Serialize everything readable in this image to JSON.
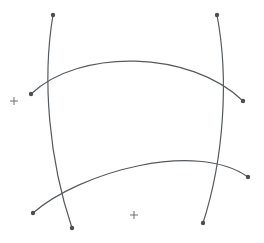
{
  "figure": {
    "width": 264,
    "height": 243,
    "background_color": "#ffffff",
    "stroke_color": "#555a5e",
    "stroke_width": 1.2,
    "endpoint_dot_color": "#4a4f53",
    "endpoint_dot_radius": 2.2,
    "registration_mark_color": "#6d7276"
  },
  "curves": [
    {
      "id": "left-vertical-curve",
      "name": "left-vertical-curve",
      "orientation": "vertical",
      "bows": "left",
      "start": {
        "x": 53,
        "y": 15
      },
      "end": {
        "x": 72,
        "y": 228
      },
      "control1": {
        "x": 42,
        "y": 80
      },
      "control2": {
        "x": 49,
        "y": 160
      },
      "path": "M 53 15 C 42 80 49 160 72 228",
      "endpoints": [
        {
          "x": 53,
          "y": 15
        },
        {
          "x": 72,
          "y": 228
        }
      ]
    },
    {
      "id": "right-vertical-curve",
      "name": "right-vertical-curve",
      "orientation": "vertical",
      "bows": "right",
      "start": {
        "x": 217,
        "y": 15
      },
      "end": {
        "x": 203,
        "y": 223
      },
      "control1": {
        "x": 229,
        "y": 78
      },
      "control2": {
        "x": 224,
        "y": 158
      },
      "path": "M 217 15 C 229 78 224 158 203 223",
      "endpoints": [
        {
          "x": 217,
          "y": 15
        },
        {
          "x": 203,
          "y": 223
        }
      ]
    },
    {
      "id": "upper-horizontal-arc",
      "name": "upper-horizontal-arc",
      "orientation": "horizontal",
      "bows": "up",
      "start": {
        "x": 31,
        "y": 94
      },
      "end": {
        "x": 243,
        "y": 101
      },
      "control1": {
        "x": 80,
        "y": 48
      },
      "control2": {
        "x": 190,
        "y": 50
      },
      "path": "M 31 94 C 80 48 190 50 243 101",
      "apex": {
        "x": 133,
        "y": 53
      },
      "endpoints": [
        {
          "x": 31,
          "y": 94
        },
        {
          "x": 243,
          "y": 101
        }
      ]
    },
    {
      "id": "lower-horizontal-arc",
      "name": "lower-horizontal-arc",
      "orientation": "horizontal",
      "bows": "up",
      "start": {
        "x": 33,
        "y": 213
      },
      "end": {
        "x": 248,
        "y": 177
      },
      "control1": {
        "x": 80,
        "y": 172
      },
      "control2": {
        "x": 196,
        "y": 140
      },
      "path": "M 33 213 C 80 172 196 140 248 177",
      "apex": {
        "x": 152,
        "y": 148
      },
      "endpoints": [
        {
          "x": 33,
          "y": 213
        },
        {
          "x": 248,
          "y": 177
        }
      ]
    }
  ],
  "registration_marks": [
    {
      "id": "reg-mark-left",
      "name": "registration-mark-left",
      "x": 14,
      "y": 101,
      "arm_length": 4
    },
    {
      "id": "reg-mark-bottom",
      "name": "registration-mark-bottom",
      "x": 134,
      "y": 215,
      "arm_length": 4
    }
  ],
  "chart_data": {
    "type": "line",
    "xlabel": "",
    "ylabel": "",
    "xlim": [
      0,
      264
    ],
    "ylim": [
      0,
      243
    ],
    "grid": false,
    "legend": "none",
    "series": [
      {
        "name": "left-vertical-curve",
        "x": [
          53,
          48,
          45,
          44,
          45,
          48,
          53,
          59,
          66,
          72
        ],
        "y": [
          15,
          39,
          63,
          87,
          111,
          135,
          158,
          182,
          205,
          228
        ]
      },
      {
        "name": "right-vertical-curve",
        "x": [
          217,
          222,
          225,
          227,
          227,
          226,
          223,
          218,
          211,
          203
        ],
        "y": [
          15,
          38,
          61,
          84,
          107,
          130,
          153,
          176,
          200,
          223
        ]
      },
      {
        "name": "upper-horizontal-arc",
        "x": [
          31,
          54,
          78,
          101,
          125,
          149,
          172,
          196,
          220,
          243
        ],
        "y": [
          94,
          76,
          64,
          57,
          53,
          53,
          58,
          68,
          82,
          101
        ]
      },
      {
        "name": "lower-horizontal-arc",
        "x": [
          33,
          57,
          81,
          105,
          129,
          152,
          176,
          200,
          224,
          248
        ],
        "y": [
          213,
          199,
          186,
          175,
          165,
          157,
          152,
          150,
          160,
          177
        ]
      }
    ],
    "annotations": [
      {
        "label": "+",
        "x": 14,
        "y": 101
      },
      {
        "label": "+",
        "x": 134,
        "y": 215
      }
    ]
  }
}
